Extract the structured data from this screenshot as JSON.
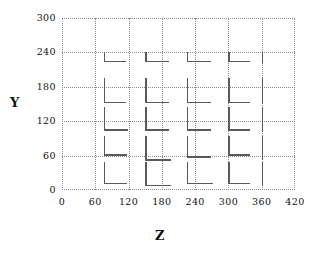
{
  "chart_data": {
    "type": "scatter",
    "title": "",
    "subtitle": "",
    "xlabel": "Z",
    "ylabel": "Y",
    "xlim": [
      0,
      420
    ],
    "ylim": [
      0,
      300
    ],
    "xticks": [
      0,
      60,
      120,
      180,
      240,
      300,
      360,
      420
    ],
    "yticks": [
      0,
      60,
      120,
      180,
      240,
      300
    ],
    "grid": true,
    "legend": null,
    "annotations": [],
    "marker": "L-shaped-glyph",
    "marker_note": "Each data point is drawn as an L / crosshair glyph: a vertical stem whose top sits at the point, with a horizontal arm extending to the right from the stem's lower end. Stem and arm lengths vary per point.",
    "x": [
      75,
      150,
      225,
      300,
      360
    ],
    "y": [
      240,
      195,
      145,
      95,
      48
    ],
    "points": [
      {
        "z": 75,
        "y": 240,
        "stem": 10,
        "arm": 22
      },
      {
        "z": 150,
        "y": 240,
        "stem": 10,
        "arm": 24
      },
      {
        "z": 225,
        "y": 240,
        "stem": 10,
        "arm": 24
      },
      {
        "z": 300,
        "y": 240,
        "stem": 10,
        "arm": 22
      },
      {
        "z": 360,
        "y": 240,
        "stem": 11,
        "arm": 0
      },
      {
        "z": 75,
        "y": 195,
        "stem": 25,
        "arm": 22
      },
      {
        "z": 150,
        "y": 195,
        "stem": 25,
        "arm": 24
      },
      {
        "z": 225,
        "y": 195,
        "stem": 25,
        "arm": 24
      },
      {
        "z": 300,
        "y": 195,
        "stem": 25,
        "arm": 22
      },
      {
        "z": 360,
        "y": 195,
        "stem": 26,
        "arm": 0
      },
      {
        "z": 75,
        "y": 145,
        "stem": 24,
        "arm": 24
      },
      {
        "z": 150,
        "y": 145,
        "stem": 24,
        "arm": 24
      },
      {
        "z": 225,
        "y": 145,
        "stem": 24,
        "arm": 24
      },
      {
        "z": 300,
        "y": 145,
        "stem": 24,
        "arm": 22
      },
      {
        "z": 360,
        "y": 145,
        "stem": 25,
        "arm": 0
      },
      {
        "z": 75,
        "y": 95,
        "stem": 20,
        "arm": 23
      },
      {
        "z": 150,
        "y": 95,
        "stem": 25,
        "arm": 26
      },
      {
        "z": 225,
        "y": 95,
        "stem": 22,
        "arm": 24
      },
      {
        "z": 300,
        "y": 95,
        "stem": 20,
        "arm": 22
      },
      {
        "z": 360,
        "y": 95,
        "stem": 24,
        "arm": 0
      },
      {
        "z": 75,
        "y": 48,
        "stem": 22,
        "arm": 23
      },
      {
        "z": 150,
        "y": 48,
        "stem": 24,
        "arm": 26
      },
      {
        "z": 225,
        "y": 48,
        "stem": 22,
        "arm": 26
      },
      {
        "z": 300,
        "y": 48,
        "stem": 22,
        "arm": 22
      },
      {
        "z": 360,
        "y": 48,
        "stem": 24,
        "arm": 0
      }
    ],
    "colors": {
      "mark": "#5a5a5a",
      "grid": "#8e8e8e",
      "text": "#111111",
      "background": "#ffffff"
    }
  }
}
